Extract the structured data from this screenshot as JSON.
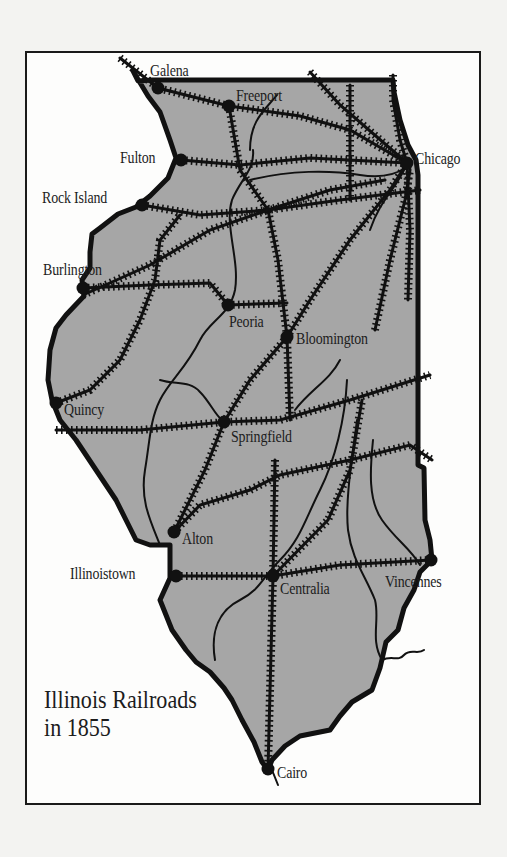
{
  "title": {
    "line1": "Illinois Railroads",
    "line2": "in 1855"
  },
  "colors": {
    "page_background": "#f3f3f1",
    "frame_background": "#fdfdfc",
    "state_fill": "#a6a6a6",
    "ink": "#111111"
  },
  "cities": [
    {
      "name": "Galena",
      "x": 158,
      "y": 88,
      "label_x": 150,
      "label_y": 62
    },
    {
      "name": "Freeport",
      "x": 229,
      "y": 106,
      "label_x": 236,
      "label_y": 87
    },
    {
      "name": "Chicago",
      "x": 407,
      "y": 163,
      "label_x": 415,
      "label_y": 150
    },
    {
      "name": "Fulton",
      "x": 181,
      "y": 160,
      "label_x": 120,
      "label_y": 149
    },
    {
      "name": "Rock Island",
      "x": 142,
      "y": 205,
      "label_x": 42,
      "label_y": 189
    },
    {
      "name": "Burlington",
      "x": 83,
      "y": 288,
      "label_x": 43,
      "label_y": 261
    },
    {
      "name": "Peoria",
      "x": 228,
      "y": 305,
      "label_x": 229,
      "label_y": 313
    },
    {
      "name": "Bloomington",
      "x": 287,
      "y": 337,
      "label_x": 296,
      "label_y": 330
    },
    {
      "name": "Quincy",
      "x": 56,
      "y": 403,
      "label_x": 64,
      "label_y": 401
    },
    {
      "name": "Springfield",
      "x": 224,
      "y": 422,
      "label_x": 231,
      "label_y": 428
    },
    {
      "name": "Alton",
      "x": 174,
      "y": 532,
      "label_x": 182,
      "label_y": 530
    },
    {
      "name": "Illinoistown",
      "x": 176,
      "y": 576,
      "label_x": 70,
      "label_y": 565
    },
    {
      "name": "Centralia",
      "x": 273,
      "y": 576,
      "label_x": 280,
      "label_y": 580
    },
    {
      "name": "Vincennes",
      "x": 431,
      "y": 560,
      "label_x": 385,
      "label_y": 573
    },
    {
      "name": "Cairo",
      "x": 268,
      "y": 769,
      "label_x": 277,
      "label_y": 764
    }
  ],
  "state_outline": "M133,71 L138,81 L152,80 L393,80 L394,92 L400,120 L408,145 L416,160 L418,175 L418,465 L424,468 L425,520 L430,540 L432,560 L420,572 L414,590 L404,608 L398,630 L386,642 L380,668 L372,690 L352,702 L340,716 L330,730 L300,736 L285,746 L272,760 L268,770 L262,762 L254,742 L242,720 L232,700 L224,688 L210,672 L196,662 L186,650 L172,630 L160,600 L170,578 L170,550 L170,545 L150,545 L136,540 L126,520 L116,500 L96,470 L76,440 L60,420 L52,400 L48,380 L50,350 L56,328 L66,315 L84,296 L82,280 L90,268 L90,252 L92,234 L100,228 L118,214 L136,207 L150,196 L168,178 L176,158 L170,140 L160,112 L148,96 Z",
  "rivers": [
    "M253,150 C255,170 240,180 232,200 C224,225 240,260 235,290 C230,315 210,320 200,340 C185,370 170,380 160,400 C150,420 150,440 145,470 C140,500 150,520 160,545",
    "M160,380 C175,385 190,380 200,392 C210,402 215,415 222,420",
    "M277,95 C265,110 250,120 250,150",
    "M250,180 C290,170 330,170 360,175 C380,178 395,175 405,168",
    "M405,168 C395,190 380,200 370,230",
    "M340,360 C330,380 310,390 295,410",
    "M347,380 C345,420 335,460 320,490 C305,520 300,540 280,560 C262,578 260,590 240,600 C220,610 210,630 215,660",
    "M357,420 C352,460 345,500 348,530 C352,560 365,575 375,600 C380,620 370,640 382,660",
    "M373,440 C370,470 368,500 382,520 C396,540 410,548 420,565",
    "M272,770 L278,785",
    "M382,660 C392,655 398,662 404,655 C410,648 418,655 424,650"
  ],
  "railroads": [
    "M120,58 L158,88 L229,106 L300,116 L350,130 L407,163",
    "M229,106 L240,170 L268,210 L278,260 L287,337",
    "M181,160 L240,165 L310,158 L407,163",
    "M142,205 L200,215 L268,210 L340,200 L420,190",
    "M83,288 L150,285 L210,283 L228,305",
    "M83,295 L150,265 L210,230 L268,210 L330,190 L385,180",
    "M228,305 L287,303",
    "M287,337 L310,300 L350,240 L390,190 L407,163",
    "M375,330 L390,260 L405,200 L410,170",
    "M287,337 L290,420",
    "M287,337 L250,380 L224,422 L205,470 L174,532",
    "M56,403 L90,390 L120,360 L140,320 L155,280 L160,240 L180,215",
    "M56,430 L140,430 L224,422 L280,420 L350,400 L430,375",
    "M174,532 L200,505 L250,490 L280,475 L350,460 L410,445 L432,460",
    "M176,576 L273,576 L340,565 L431,560",
    "M273,576 L328,520 L350,470 L362,400",
    "M275,460 L273,576 L268,769",
    "M393,75 L393,100 L400,140 L407,163",
    "M350,85 L350,130 L350,200",
    "M310,72 L340,105 L407,163",
    "M407,163 L410,230 L408,300"
  ]
}
